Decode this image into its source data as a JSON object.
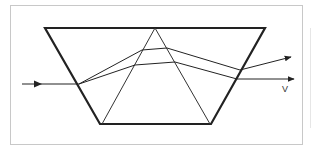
{
  "diagram": {
    "type": "optical-prism-dispersion",
    "shapes": {
      "trapezoid": {
        "points": [
          [
            45,
            28
          ],
          [
            265,
            28
          ],
          [
            211,
            124
          ],
          [
            100,
            124
          ]
        ],
        "stroke": "#222222",
        "stroke_width": 2.2
      },
      "inner_triangle": {
        "points": [
          [
            155,
            28
          ],
          [
            102,
            124
          ],
          [
            210,
            124
          ]
        ],
        "stroke": "#333333",
        "stroke_width": 1
      }
    },
    "rays": {
      "incident": {
        "from": [
          22,
          84
        ],
        "to": [
          79,
          84
        ]
      },
      "upper_ray": {
        "points": [
          [
            79,
            84
          ],
          [
            142,
            50
          ],
          [
            167,
            48
          ],
          [
            240,
            70
          ],
          [
            290,
            57
          ]
        ]
      },
      "lower_ray": {
        "points": [
          [
            79,
            84
          ],
          [
            135,
            65
          ],
          [
            175,
            62
          ],
          [
            237,
            79
          ],
          [
            294,
            79
          ]
        ]
      }
    },
    "labels": {
      "exit_label": "V"
    },
    "colors": {
      "line": "#222222",
      "frame": "#c8c8c8",
      "background": "#ffffff"
    }
  }
}
